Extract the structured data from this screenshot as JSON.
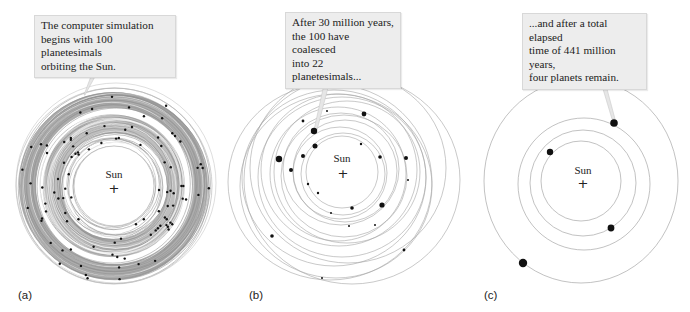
{
  "figure": {
    "panels": [
      {
        "id": "a",
        "label": "(a)",
        "callout": "The computer simulation\nbegins with 100 planetesimals\norbiting the Sun.",
        "sun_label": "Sun",
        "planetesimal_count": 100
      },
      {
        "id": "b",
        "label": "(b)",
        "callout": "After 30 million years,\nthe 100 have coalesced\ninto 22 planetesimals...",
        "sun_label": "Sun",
        "elapsed_million_years": 30,
        "planetesimal_count": 22
      },
      {
        "id": "c",
        "label": "(c)",
        "callout": "...and after a total elapsed\ntime of 441 million years,\nfour planets remain.",
        "sun_label": "Sun",
        "elapsed_million_years": 441,
        "planet_count": 4
      }
    ],
    "colors": {
      "orbit_line": "#9a9a9a",
      "ring_fill": "#9d9d9d",
      "callout_bg": "#ededed",
      "body_dot": "#111111"
    }
  }
}
